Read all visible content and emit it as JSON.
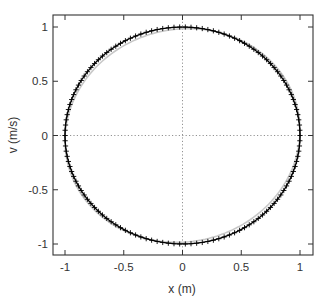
{
  "chart_data": {
    "type": "line",
    "title": "",
    "xlabel": "x (m)",
    "ylabel": "v (m/s)",
    "xlim": [
      -1.08,
      1.08
    ],
    "ylim": [
      -1.1,
      1.1
    ],
    "xticks": [
      -1,
      -0.5,
      0,
      0.5,
      1
    ],
    "xtick_labels": [
      "-1",
      "-0.5",
      "0",
      "0.5",
      "1"
    ],
    "yticks": [
      -1,
      -0.5,
      0,
      0.5,
      1
    ],
    "ytick_labels": [
      "-1",
      "-0.5",
      "0",
      "0.5",
      "1"
    ],
    "grid": false,
    "zero_lines": {
      "x0": true,
      "y0": true,
      "style": "dotted"
    },
    "legend": null,
    "series": [
      {
        "name": "reference orbit",
        "style": "solid line",
        "color": "#c8c8c8",
        "description": "closed phase-space orbit, nearly unit circle, slightly tilted ellipse",
        "parametric": {
          "x_amplitude": 1.0,
          "v_amplitude": 0.985,
          "phase_offset_rad": 0.05,
          "points": 180
        }
      },
      {
        "name": "simulated trajectory",
        "style": "solid line with + markers",
        "color": "#000000",
        "description": "clockwise phase-space orbit x=cos(t), v=-sin(t), amplitude ~1",
        "parametric": {
          "x_amplitude": 1.0,
          "v_amplitude": 1.0,
          "phase_offset_rad": 0.0,
          "points": 130
        }
      }
    ],
    "sample_points": {
      "x": [
        1,
        0.707,
        0,
        -0.707,
        -1,
        -0.707,
        0,
        0.707,
        1
      ],
      "v": [
        0,
        0.707,
        1,
        0.707,
        0,
        -0.707,
        -1,
        -0.707,
        0
      ]
    }
  },
  "axes": {
    "x_label": "x (m)",
    "y_label": "v (m/s)"
  }
}
